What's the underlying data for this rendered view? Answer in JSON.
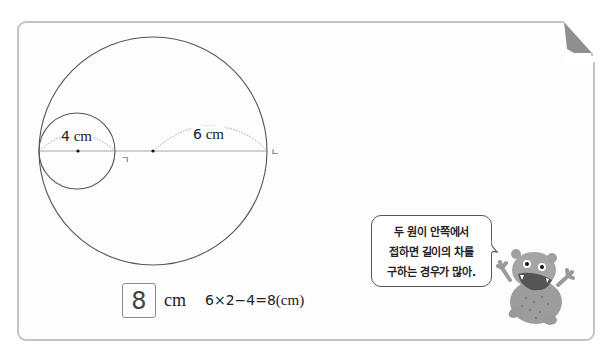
{
  "diagram": {
    "small_circle": {
      "cx": 77,
      "cy": 151,
      "r": 38,
      "radius_label_value": "4",
      "radius_label_unit": "cm"
    },
    "large_circle": {
      "cx": 153,
      "cy": 151,
      "r": 114,
      "radius_label_value": "6",
      "radius_label_unit": "cm"
    },
    "point_labels": {
      "giyeok": "ㄱ",
      "nieun": "ㄴ"
    },
    "stroke_color": "#555555",
    "dotted_color": "#8a8a8a"
  },
  "answer": {
    "value": "8",
    "unit": "cm",
    "calculation_expr": "6×2−4=8",
    "calculation_unit": "(cm)"
  },
  "speech_bubble": {
    "lines": [
      "두 원이 안쪽에서",
      "접하면 길이의 차를",
      "구하는 경우가 많아."
    ]
  },
  "character": {
    "name": "monster-mascot",
    "body_color": "#9a9a9a"
  },
  "colors": {
    "frame_border": "#c4c4c4",
    "page_curl": "#8f8f8f",
    "background": "#fdfdfd"
  }
}
